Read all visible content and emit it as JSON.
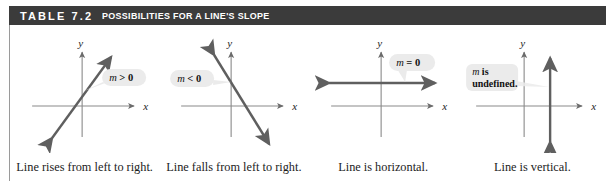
{
  "header": {
    "label": "TABLE 7.2",
    "title": "POSSIBILITIES FOR A LINE'S SLOPE",
    "bar_color": "#3b3b3b",
    "text_color": "#ffffff"
  },
  "axis_labels": {
    "x": "x",
    "y": "y"
  },
  "colors": {
    "axis": "#8a8a8a",
    "line": "#5f5f5f",
    "callout_fill": "#ebebeb",
    "caption": "#1c1c1c"
  },
  "panels": [
    {
      "id": "positive-slope",
      "callout": "m > 0",
      "caption": "Line rises from left to right.",
      "x_label": "x",
      "y_label": "y"
    },
    {
      "id": "negative-slope",
      "callout": "m < 0",
      "caption": "Line falls from left to right.",
      "x_label": "x",
      "y_label": "y"
    },
    {
      "id": "zero-slope",
      "callout": "m = 0",
      "caption": "Line is horizontal.",
      "x_label": "x",
      "y_label": "y"
    },
    {
      "id": "undefined-slope",
      "callout_line1": "m is",
      "callout_line2": "undefined.",
      "caption": "Line is vertical.",
      "x_label": "x",
      "y_label": "y"
    }
  ]
}
